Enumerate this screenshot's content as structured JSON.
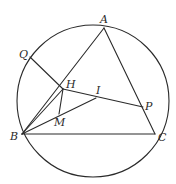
{
  "figure": {
    "circle": {
      "cx": 93,
      "cy": 101,
      "r": 76
    },
    "points": {
      "A": {
        "label": "A",
        "x": 104,
        "y": 28
      },
      "B": {
        "label": "B",
        "x": 22,
        "y": 134
      },
      "C": {
        "label": "C",
        "x": 155,
        "y": 134
      },
      "Q": {
        "label": "Q",
        "x": 30,
        "y": 57
      },
      "H": {
        "label": "H",
        "x": 63,
        "y": 89
      },
      "I": {
        "label": "I",
        "x": 96,
        "y": 98
      },
      "P": {
        "label": "P",
        "x": 143,
        "y": 107
      },
      "M": {
        "label": "M",
        "x": 59,
        "y": 114
      }
    },
    "segments": [
      [
        "A",
        "B"
      ],
      [
        "B",
        "C"
      ],
      [
        "A",
        "C"
      ],
      [
        "Q",
        "H"
      ],
      [
        "H",
        "P"
      ],
      [
        "B",
        "H"
      ],
      [
        "B",
        "I"
      ],
      [
        "H",
        "M"
      ]
    ],
    "labels": {
      "A": "A",
      "B": "B",
      "C": "C",
      "Q": "Q",
      "H": "H",
      "I": "I",
      "P": "P",
      "M": "M"
    }
  }
}
